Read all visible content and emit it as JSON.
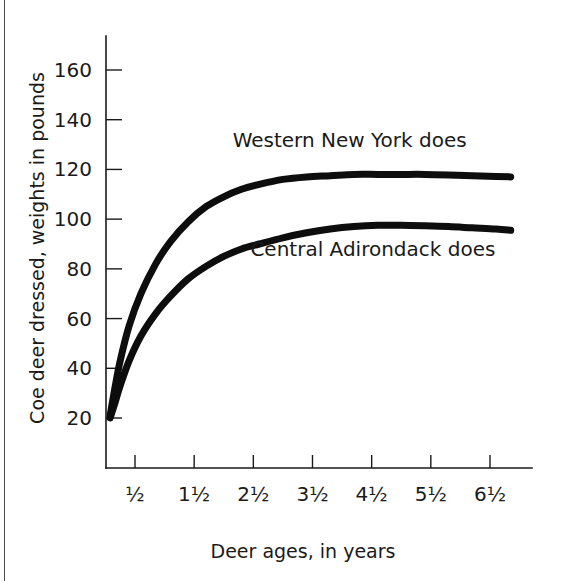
{
  "figure": {
    "background_color": "#ffffff",
    "ink_color": "#0d0d0d"
  },
  "chart_data": {
    "type": "line",
    "title": "",
    "xlabel": "Deer ages, in years",
    "ylabel": "Coe deer dressed, weights in pounds",
    "xlim": [
      0,
      7
    ],
    "ylim": [
      0,
      175
    ],
    "grid": false,
    "legend_position": "inline-annotation",
    "x_tick_values": [
      0.5,
      1.5,
      2.5,
      3.5,
      4.5,
      5.5,
      6.5
    ],
    "x_tick_labels": [
      "½",
      "1½",
      "2½",
      "3½",
      "4½",
      "5½",
      "6½"
    ],
    "y_tick_values": [
      20,
      40,
      60,
      80,
      100,
      120,
      140,
      160
    ],
    "y_tick_labels": [
      "20",
      "40",
      "60",
      "80",
      "100",
      "120",
      "140",
      "160"
    ],
    "series": [
      {
        "name": "Western New York does",
        "annotation": "Western New York does",
        "annotation_x": 2.15,
        "annotation_y": 129,
        "x": [
          0.08,
          0.16,
          0.25,
          0.4,
          0.6,
          0.85,
          1.1,
          1.4,
          1.7,
          2.0,
          2.3,
          2.6,
          3.0,
          3.4,
          3.8,
          4.2,
          4.6,
          5.0,
          5.4,
          5.8,
          6.2,
          6.6,
          6.85
        ],
        "values": [
          21,
          32,
          43,
          57,
          70,
          82,
          91,
          99,
          105,
          109,
          112,
          114,
          116,
          117,
          117.5,
          118,
          118,
          118,
          118,
          117.8,
          117.5,
          117.2,
          117
        ]
      },
      {
        "name": "Central Adirondack does",
        "annotation": "Central Adirondack does",
        "annotation_x": 2.45,
        "annotation_y": 85,
        "x": [
          0.08,
          0.16,
          0.25,
          0.4,
          0.6,
          0.85,
          1.1,
          1.4,
          1.7,
          2.0,
          2.3,
          2.6,
          3.0,
          3.4,
          3.8,
          4.2,
          4.6,
          5.0,
          5.4,
          5.8,
          6.2,
          6.6,
          6.85
        ],
        "values": [
          20,
          26,
          33,
          43,
          53,
          62,
          69,
          76,
          81,
          85,
          88,
          90,
          92.5,
          94.5,
          96,
          97,
          97.5,
          97.5,
          97.3,
          97,
          96.5,
          96,
          95.5
        ]
      }
    ]
  }
}
